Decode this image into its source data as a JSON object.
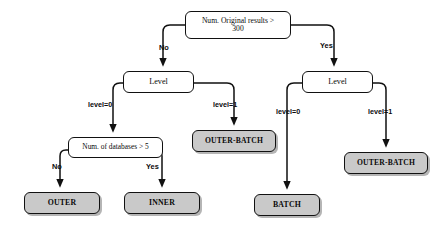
{
  "diagram": {
    "type": "decision-tree",
    "title": "",
    "colors": {
      "leaf_fill": "#c9c9c9",
      "decision_fill": "#ffffff",
      "stroke": "#111111",
      "background": "#ffffff"
    },
    "nodes": [
      {
        "id": "root",
        "kind": "decision",
        "label": "Num. Original results >\n300",
        "x": 185,
        "y": 11,
        "w": 106,
        "h": 28,
        "font_size": 7.6
      },
      {
        "id": "level-left",
        "kind": "decision",
        "label": "Level",
        "x": 123,
        "y": 71,
        "w": 71,
        "h": 22,
        "font_size": 8.2
      },
      {
        "id": "level-right",
        "kind": "decision",
        "label": "Level",
        "x": 302,
        "y": 71,
        "w": 71,
        "h": 22,
        "font_size": 8.2
      },
      {
        "id": "num-databases",
        "kind": "decision",
        "label": "Num. of databases > 5",
        "x": 68,
        "y": 137,
        "w": 95,
        "h": 21,
        "font_size": 7.4
      },
      {
        "id": "outer-batch-left",
        "kind": "leaf",
        "label": "OUTER-BATCH",
        "x": 192,
        "y": 130,
        "w": 84,
        "h": 22,
        "font_size": 7.6
      },
      {
        "id": "outer-batch-right",
        "kind": "leaf",
        "label": "OUTER-BATCH",
        "x": 344,
        "y": 152,
        "w": 84,
        "h": 22,
        "font_size": 7.6
      },
      {
        "id": "outer",
        "kind": "leaf",
        "label": "OUTER",
        "x": 24,
        "y": 192,
        "w": 76,
        "h": 22,
        "font_size": 7.8
      },
      {
        "id": "inner",
        "kind": "leaf",
        "label": "INNER",
        "x": 124,
        "y": 192,
        "w": 76,
        "h": 22,
        "font_size": 7.8
      },
      {
        "id": "batch",
        "kind": "leaf",
        "label": "BATCH",
        "x": 254,
        "y": 194,
        "w": 66,
        "h": 22,
        "font_size": 7.8
      }
    ],
    "edges": [
      {
        "id": "root-no",
        "from": "root",
        "to": "level-left",
        "label": "No",
        "label_x": 159,
        "label_y": 43,
        "font_size": 7.4
      },
      {
        "id": "root-yes",
        "from": "root",
        "to": "level-right",
        "label": "Yes",
        "label_x": 320,
        "label_y": 41,
        "font_size": 7.4
      },
      {
        "id": "left-lvl0",
        "from": "level-left",
        "to": "num-databases",
        "label": "level=0",
        "label_x": 88,
        "label_y": 100,
        "font_size": 7.2
      },
      {
        "id": "left-lvl1",
        "from": "level-left",
        "to": "outer-batch-left",
        "label": "level=1",
        "label_x": 213,
        "label_y": 100,
        "font_size": 7.2
      },
      {
        "id": "right-lvl0",
        "from": "level-right",
        "to": "batch",
        "label": "level=0",
        "label_x": 276,
        "label_y": 107,
        "font_size": 7.2
      },
      {
        "id": "right-lvl1",
        "from": "level-right",
        "to": "outer-batch-right",
        "label": "level=1",
        "label_x": 368,
        "label_y": 107,
        "font_size": 7.2
      },
      {
        "id": "db-no",
        "from": "num-databases",
        "to": "outer",
        "label": "No",
        "label_x": 52,
        "label_y": 162,
        "font_size": 7.4
      },
      {
        "id": "db-yes",
        "from": "num-databases",
        "to": "inner",
        "label": "Yes",
        "label_x": 146,
        "label_y": 162,
        "font_size": 7.4
      }
    ]
  }
}
